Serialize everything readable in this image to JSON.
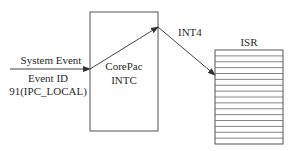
{
  "diagram": {
    "input": {
      "label_top": "System Event",
      "label_mid": "Event ID",
      "label_bottom": "91(IPC_LOCAL)"
    },
    "intc_box": {
      "line1": "CorePac",
      "line2": "INTC"
    },
    "output": {
      "label": "INT4"
    },
    "isr_table": {
      "title": "ISR",
      "row_count": 16
    },
    "colors": {
      "stroke": "#555555",
      "text": "#2a2a2a",
      "background": "#ffffff"
    }
  }
}
